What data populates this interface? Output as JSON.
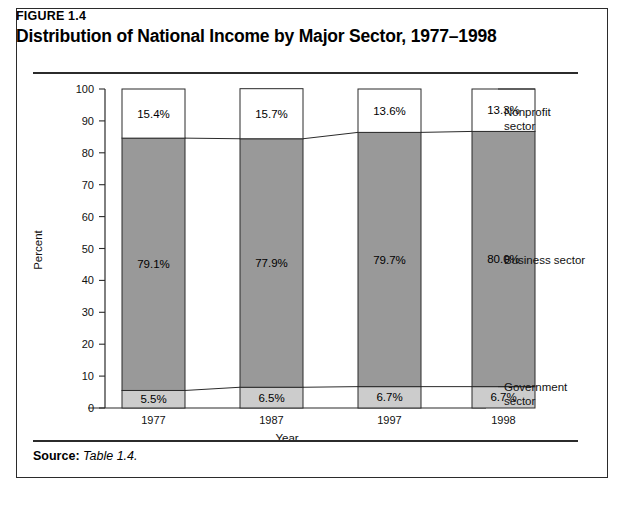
{
  "figure": {
    "number": "FIGURE 1.4",
    "title": "Distribution of National Income by Major Sector, 1977–1998"
  },
  "source": {
    "label": "Source:",
    "value": "Table 1.4."
  },
  "chart_data": {
    "type": "bar",
    "subtype": "stacked-column",
    "title": "Distribution of National Income by Major Sector, 1977–1998",
    "xlabel": "Year",
    "ylabel": "Percent",
    "ylim": [
      0,
      100
    ],
    "yticks": [
      0,
      10,
      20,
      30,
      40,
      50,
      60,
      70,
      80,
      90,
      100
    ],
    "ytick_labels": [
      "0",
      "10",
      "20",
      "30",
      "40",
      "50",
      "60",
      "70",
      "80",
      "90",
      "100"
    ],
    "grid": false,
    "legend_position": "right",
    "categories": [
      "1977",
      "1987",
      "1997",
      "1998"
    ],
    "series": [
      {
        "name": "Government sector",
        "legend_lines": [
          "Government",
          "sector"
        ],
        "color": "#cccccc",
        "values": [
          5.5,
          6.5,
          6.7,
          6.7
        ],
        "labels": [
          "5.5%",
          "6.5%",
          "6.7%",
          "6.7%"
        ]
      },
      {
        "name": "Business sector",
        "legend_lines": [
          "Business sector"
        ],
        "color": "#999999",
        "values": [
          79.1,
          77.9,
          79.7,
          80.0
        ],
        "labels": [
          "79.1%",
          "77.9%",
          "79.7%",
          "80.0%"
        ]
      },
      {
        "name": "Nonprofit sector",
        "legend_lines": [
          "Nonprofit",
          "sector"
        ],
        "color": "#ffffff",
        "values": [
          15.4,
          15.7,
          13.6,
          13.3
        ],
        "labels": [
          "15.4%",
          "15.7%",
          "13.6%",
          "13.3%"
        ]
      }
    ]
  }
}
